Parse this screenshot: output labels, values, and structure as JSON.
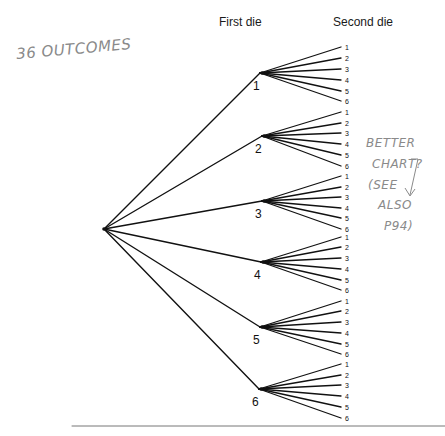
{
  "headers": {
    "first_die": "First die",
    "second_die": "Second die"
  },
  "annotations": {
    "outcomes_note": "36 OUTCOMES",
    "side_note_lines": [
      "BETTER",
      "CHART?",
      "(SEE",
      "ALSO",
      "P94)"
    ]
  },
  "tree": {
    "root": {
      "x": 104,
      "y": 229
    },
    "leaf_x": 341,
    "leaf_label_x": 345,
    "first_die": [
      {
        "label": "1",
        "x": 260,
        "y": 73,
        "leaves": [
          47,
          58,
          69,
          80,
          91,
          101
        ]
      },
      {
        "label": "2",
        "x": 262,
        "y": 136,
        "leaves": [
          112,
          123,
          133,
          144,
          155,
          166
        ]
      },
      {
        "label": "3",
        "x": 262,
        "y": 201,
        "leaves": [
          176,
          187,
          197,
          208,
          218,
          229
        ]
      },
      {
        "label": "4",
        "x": 261,
        "y": 262,
        "leaves": [
          237,
          247,
          258,
          269,
          280,
          290
        ]
      },
      {
        "label": "5",
        "x": 260,
        "y": 327,
        "leaves": [
          301,
          311,
          322,
          333,
          344,
          354
        ]
      },
      {
        "label": "6",
        "x": 259,
        "y": 389,
        "leaves": [
          364,
          375,
          385,
          396,
          407,
          418
        ]
      }
    ],
    "second_die_labels": [
      "1",
      "2",
      "3",
      "4",
      "5",
      "6"
    ]
  },
  "rule": {
    "x1": 72,
    "x2": 445,
    "y": 426
  },
  "colors": {
    "ink": "#111111",
    "pencil": "#8a8a8a",
    "rule": "#777777"
  }
}
